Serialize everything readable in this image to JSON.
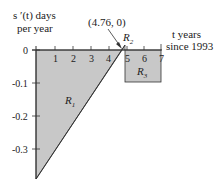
{
  "diagram": {
    "y_axis_label_line1": "s ′(t) days",
    "y_axis_label_line2": "per year",
    "x_axis_label_line1": "t years",
    "x_axis_label_line2": "since 1993",
    "point_label": "(4.76, 0)",
    "x_ticks": [
      "1",
      "2",
      "3",
      "4",
      "5",
      "6",
      "7"
    ],
    "y_ticks": [
      "0",
      "-0.1",
      "-0.2",
      "-0.3"
    ],
    "regions": {
      "r1": {
        "letter": "R",
        "sub": "1"
      },
      "r2": {
        "letter": "R",
        "sub": "2"
      },
      "r3": {
        "letter": "R",
        "sub": "3"
      }
    },
    "colors": {
      "fill": "#c8c8c8",
      "stroke": "#333333"
    }
  }
}
